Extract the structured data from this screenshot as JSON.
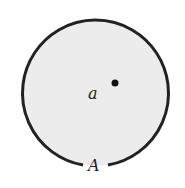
{
  "diagram": {
    "region": {
      "fill": "#ececec",
      "stroke": "#222222",
      "center": [
        95,
        93
      ],
      "radius": 73,
      "gap_at_bottom": true
    },
    "point": {
      "label": "a",
      "dot_position": [
        115,
        83
      ]
    },
    "boundary_label": "A"
  }
}
